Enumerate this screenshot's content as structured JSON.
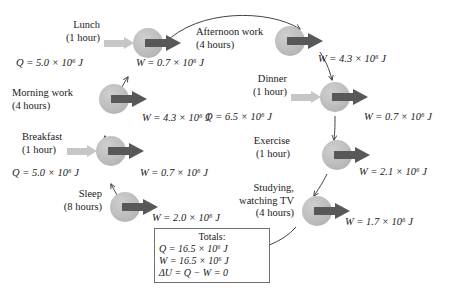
{
  "diagram": {
    "colors": {
      "node": "#bdbdbd",
      "heat_arrow": "#c6c6c6",
      "work_arrow": "#585858",
      "wire": "#3a3a3a",
      "box_border": "#6f6f6f",
      "text": "#1a1a1a",
      "background": "#ffffff"
    },
    "nodes": [
      {
        "id": "lunch",
        "name": "Lunch",
        "duration": "(1 hour)",
        "heat_label": "Q = 5.0 × 10⁶ J",
        "work_label": "W = 0.7 × 10⁶ J",
        "has_heat": true,
        "has_work": true
      },
      {
        "id": "afternoon-work",
        "name": "Afternoon work",
        "duration": "(4 hours)",
        "heat_label": "",
        "work_label": "W = 4.3 × 10⁶ J",
        "has_heat": false,
        "has_work": true
      },
      {
        "id": "dinner",
        "name": "Dinner",
        "duration": "(1 hour)",
        "heat_label": "Q = 6.5 × 10⁶ J",
        "work_label": "W = 0.7 × 10⁶ J",
        "has_heat": true,
        "has_work": true
      },
      {
        "id": "exercise",
        "name": "Exercise",
        "duration": "(1 hour)",
        "heat_label": "",
        "work_label": "W = 2.1 × 10⁶ J",
        "has_heat": false,
        "has_work": true
      },
      {
        "id": "studying-watching-tv",
        "name": "Studying,",
        "name2": "watching TV",
        "duration": "(4 hours)",
        "heat_label": "",
        "work_label": "W = 1.7 × 10⁶ J",
        "has_heat": false,
        "has_work": true
      },
      {
        "id": "sleep",
        "name": "Sleep",
        "duration": "(8 hours)",
        "heat_label": "",
        "work_label": "W = 2.0 × 10⁶ J",
        "has_heat": false,
        "has_work": true
      },
      {
        "id": "breakfast",
        "name": "Breakfast",
        "duration": "(1 hour)",
        "heat_label": "Q = 5.0 × 10⁶ J",
        "work_label": "W = 0.7 × 10⁶ J",
        "has_heat": true,
        "has_work": true
      },
      {
        "id": "morning-work",
        "name": "Morning work",
        "duration": "(4 hours)",
        "heat_label": "",
        "work_label": "W = 4.3 × 10⁶ J",
        "has_heat": false,
        "has_work": true
      }
    ],
    "totals": {
      "heading": "Totals:",
      "heat": "Q = 16.5 × 10⁶ J",
      "work": "W = 16.5 × 10⁶ J",
      "delta_u": "ΔU = Q − W = 0"
    }
  }
}
